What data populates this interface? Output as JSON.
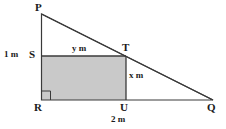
{
  "figure": {
    "canvas": {
      "width": 226,
      "height": 129,
      "background": "#ffffff"
    },
    "stroke_color": "#3a3a3a",
    "fill_color": "#c9c9c9",
    "vertices": {
      "P": {
        "label": "P",
        "x": 41,
        "y": 14
      },
      "Q": {
        "label": "Q",
        "x": 213,
        "y": 100
      },
      "R": {
        "label": "R",
        "x": 41,
        "y": 100
      },
      "S": {
        "label": "S",
        "x": 41,
        "y": 56
      },
      "T": {
        "label": "T",
        "x": 126,
        "y": 56
      },
      "U": {
        "label": "U",
        "x": 126,
        "y": 100
      }
    },
    "measurements": {
      "height_SR": "1 m",
      "width_ST": "y m",
      "height_TU": "x m",
      "width_RQ": "2 m"
    },
    "right_angle_at": "R"
  }
}
